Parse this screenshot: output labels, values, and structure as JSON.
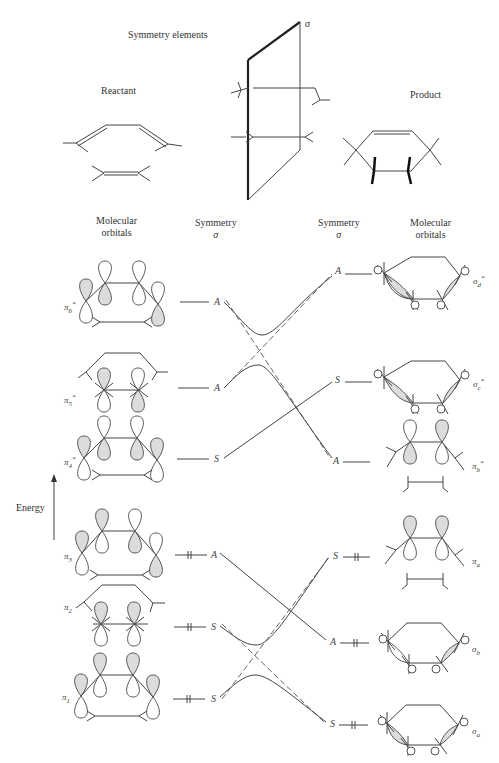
{
  "header": {
    "symmetry_elements": "Symmetry elements",
    "reactant": "Reactant",
    "product": "Product",
    "plane_label": "σ"
  },
  "columns": {
    "left_orbitals": [
      "Molecular",
      "orbitals"
    ],
    "left_symmetry": [
      "Symmetry",
      "σ"
    ],
    "right_symmetry": [
      "Symmetry",
      "σ"
    ],
    "right_orbitals": [
      "Molecular",
      "orbitals"
    ]
  },
  "axis": {
    "energy_label": "Energy"
  },
  "reactant_orbitals": [
    {
      "name": "π",
      "sub": "6",
      "star": true,
      "symmetry": "A",
      "occupied": false
    },
    {
      "name": "π",
      "sub": "5",
      "star": true,
      "symmetry": "A",
      "occupied": false
    },
    {
      "name": "π",
      "sub": "4",
      "star": true,
      "symmetry": "S",
      "occupied": false
    },
    {
      "name": "π",
      "sub": "3",
      "star": false,
      "symmetry": "A",
      "occupied": true
    },
    {
      "name": "π",
      "sub": "2",
      "star": false,
      "symmetry": "S",
      "occupied": true
    },
    {
      "name": "π",
      "sub": "1",
      "star": false,
      "symmetry": "S",
      "occupied": true
    }
  ],
  "product_orbitals": [
    {
      "name": "σ",
      "sub": "d",
      "star": true,
      "symmetry": "A",
      "occupied": false
    },
    {
      "name": "σ",
      "sub": "c",
      "star": true,
      "symmetry": "S",
      "occupied": false
    },
    {
      "name": "π",
      "sub": "b",
      "star": true,
      "symmetry": "A",
      "occupied": false
    },
    {
      "name": "π",
      "sub": "a",
      "star": false,
      "symmetry": "S",
      "occupied": true
    },
    {
      "name": "σ",
      "sub": "b",
      "star": false,
      "symmetry": "A",
      "occupied": true
    },
    {
      "name": "σ",
      "sub": "a",
      "star": false,
      "symmetry": "S",
      "occupied": true
    }
  ],
  "correlations": [
    {
      "from": "π6*",
      "to": "σd*",
      "type": "avoided-crossing"
    },
    {
      "from": "π5*",
      "to": "π_b*",
      "type": "avoided-crossing"
    },
    {
      "from": "π4*",
      "to": "σc*",
      "type": "direct"
    },
    {
      "from": "π3",
      "to": "σb",
      "type": "direct"
    },
    {
      "from": "π2",
      "to": "π_a",
      "type": "avoided-crossing"
    },
    {
      "from": "π1",
      "to": "σa",
      "type": "avoided-crossing"
    }
  ],
  "colors": {
    "line": "#444444",
    "lobe_fill": "#dcdcdc",
    "background": "#ffffff"
  }
}
